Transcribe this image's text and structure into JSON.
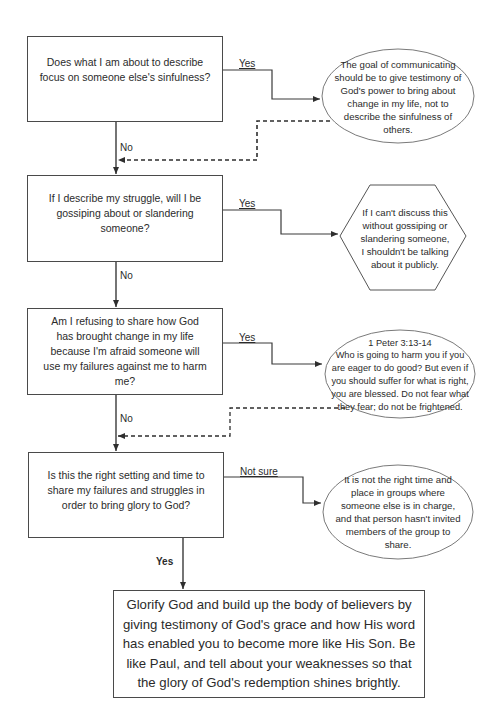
{
  "questions": [
    {
      "text": "Does what I am about to describe focus on someone else's sinfulness?"
    },
    {
      "text": "If I describe my struggle, will I be gossiping about or slandering someone?"
    },
    {
      "text": "Am I refusing to share how God has brought change in my life because I'm afraid someone will use my failures against me to harm me?"
    },
    {
      "text": "Is this the right setting and time to share my failures and struggles in order to bring glory to God?"
    }
  ],
  "outcomes": [
    {
      "shape": "ellipse",
      "text": "The goal of communicating should be to give testimony of God's power to bring about change in my life, not to describe the sinfulness of others."
    },
    {
      "shape": "hexagon",
      "text": "If I can't discuss this without gossiping or slandering someone, I shouldn't be talking about it publicly."
    },
    {
      "shape": "ellipse",
      "reference": "1 Peter 3:13-14",
      "text": "Who is going to harm you if you are eager to do good?  But even if you should suffer for what is right, you are blessed.  Do not fear what they fear; do not be frightened."
    },
    {
      "shape": "ellipse",
      "text": "It is not the right time and place in groups where someone else is in charge, and that person hasn't invited members of the group to share."
    }
  ],
  "branch_labels": {
    "q1_yes": "Yes",
    "q1_no": "No",
    "q2_yes": "Yes",
    "q2_no": "No",
    "q3_yes": "Yes",
    "q3_no": "No",
    "q4_not_sure": "Not sure",
    "q4_yes": "Yes"
  },
  "conclusion": {
    "text": "Glorify God and build up the body of believers by giving testimony of God's grace and how His word has enabled you to become more like His Son.  Be like Paul, and tell about your weaknesses so that the glory of God's redemption shines brightly."
  },
  "colors": {
    "line": "#3a3a3a",
    "shape_border": "#7a7a7a",
    "text": "#2b2b2b",
    "background": "#ffffff"
  }
}
